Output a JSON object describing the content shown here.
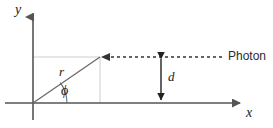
{
  "figure": {
    "background_color": "#ffffff",
    "axis_color": "#555555",
    "guide_color": "#cccccc",
    "ray_color": "#6a6a6a",
    "photon_color": "#333333",
    "dimension_color": "#222222",
    "text_color": "#1a1a1a"
  },
  "labels": {
    "y_axis": "y",
    "x_axis": "x",
    "radius": "r",
    "angle": "ϕ",
    "impact_parameter": "d",
    "photon": "Photon"
  },
  "icons": {
    "y_axis_arrow": "arrow-up-icon",
    "x_axis_arrow": "arrow-right-icon",
    "photon_arrow": "arrow-left-icon",
    "dimension_arrow": "double-arrow-vertical-icon",
    "angle_arc": "arc-icon"
  },
  "geometry": {
    "origin": {
      "x": 33,
      "y": 103
    },
    "y_axis": {
      "x": 33,
      "top": 13,
      "bottom": 120
    },
    "x_axis": {
      "y": 103,
      "left": 5,
      "right": 245
    },
    "point": {
      "x": 100,
      "y": 57
    },
    "photon_line": {
      "y": 57,
      "from_x": 222,
      "to_x": 100
    },
    "dimension_line": {
      "x": 161,
      "top_y": 55,
      "bottom_y": 104
    },
    "guide_horizontal": {
      "y": 57,
      "from_x": 33,
      "to_x": 100
    },
    "guide_vertical": {
      "x": 100,
      "from_y": 57,
      "to_y": 103
    },
    "angle_arc_radius": 34
  }
}
